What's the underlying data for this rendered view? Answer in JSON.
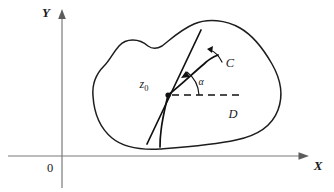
{
  "figure": {
    "type": "complex-analysis-conformal-map-diagram",
    "background_color": "#ffffff",
    "ink_color": "#111111",
    "axis_color": "#7b7b7b",
    "axes": {
      "x_label": "X",
      "y_label": "Y",
      "origin_label": "0"
    },
    "labels": {
      "point": "z",
      "point_subscript": "0",
      "curve": "C",
      "region": "D",
      "angle": "α"
    }
  }
}
